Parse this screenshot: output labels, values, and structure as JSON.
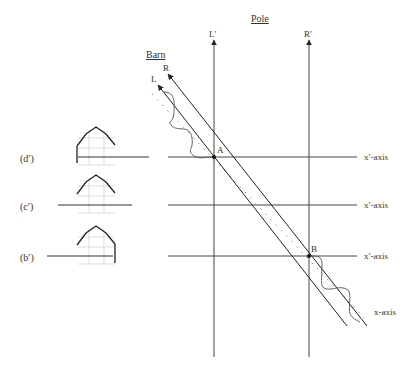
{
  "title_pole": "Pole",
  "title_barn": "Barn",
  "labels": {
    "L_prime": "L′",
    "R_prime": "R′",
    "L": "L",
    "R": "R",
    "A": "A",
    "B": "B"
  },
  "frames": [
    {
      "id": "d",
      "label": "(d′)",
      "axis_label": "x′-axis",
      "y": 157,
      "barn_side": "left"
    },
    {
      "id": "c",
      "label": "(c′)",
      "axis_label": "x′-axis",
      "y": 205,
      "barn_side": "none"
    },
    {
      "id": "b",
      "label": "(b′)",
      "axis_label": "x′-axis",
      "y": 256,
      "barn_side": "right"
    }
  ],
  "x_axis_label": "x-axis",
  "colors": {
    "line": "#222222",
    "text": "#333333",
    "barn_grid": "#c8c8c8",
    "dotted": "#888888"
  }
}
